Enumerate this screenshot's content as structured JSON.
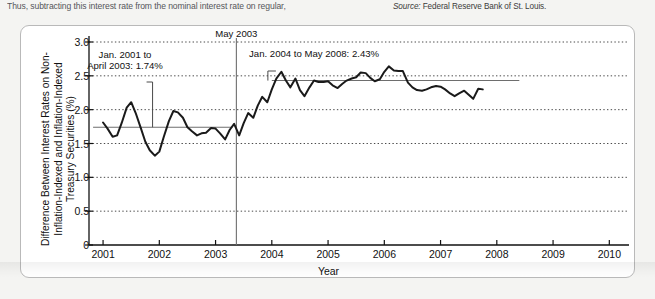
{
  "page": {
    "running_text": "Thus, subtracting this interest rate from the nominal interest rate on regular,",
    "source_prefix": "Source:",
    "source_text": " Federal Reserve Bank of St. Louis."
  },
  "chart_data": {
    "type": "line",
    "title": "",
    "xlabel": "Year",
    "ylabel": "Difference Between Interest Rates on Non-Inflation-Indexed and Inflation-Indexed Treasury Securities (%)",
    "xlim": [
      2000.75,
      2010.35
    ],
    "ylim": [
      0,
      3.0
    ],
    "grid": true,
    "legend": "none",
    "xticks": [
      "2001",
      "2002",
      "2003",
      "2004",
      "2005",
      "2006",
      "2007",
      "2008",
      "2009",
      "2010"
    ],
    "yticks": [
      "0",
      "0.5",
      "1.0",
      "1.5",
      "2.0",
      "2.5",
      "3.0"
    ],
    "annotations": [
      {
        "name": "may-2003-marker",
        "label": "May 2003",
        "x": 2003.37
      },
      {
        "name": "period-1-average",
        "label": "Jan. 2001 to\nApril 2003: 1.74%",
        "value": 1.74,
        "start": 2001.0,
        "end": 2003.3
      },
      {
        "name": "period-2-average",
        "label": "Jan. 2004 to May 2008: 2.43%",
        "value": 2.43,
        "start": 2004.0,
        "end": 2008.4
      }
    ],
    "series": [
      {
        "name": "Difference in interest rates",
        "color": "#1a1a1a",
        "x": [
          2001.0,
          2001.08,
          2001.17,
          2001.25,
          2001.33,
          2001.42,
          2001.5,
          2001.58,
          2001.67,
          2001.75,
          2001.83,
          2001.92,
          2002.0,
          2002.08,
          2002.17,
          2002.25,
          2002.33,
          2002.42,
          2002.5,
          2002.58,
          2002.67,
          2002.75,
          2002.83,
          2002.92,
          2003.0,
          2003.08,
          2003.17,
          2003.25,
          2003.33,
          2003.42,
          2003.5,
          2003.58,
          2003.67,
          2003.75,
          2003.83,
          2003.92,
          2004.0,
          2004.08,
          2004.17,
          2004.25,
          2004.33,
          2004.42,
          2004.5,
          2004.58,
          2004.67,
          2004.75,
          2004.83,
          2004.92,
          2005.0,
          2005.08,
          2005.17,
          2005.25,
          2005.33,
          2005.42,
          2005.5,
          2005.58,
          2005.67,
          2005.75,
          2005.83,
          2005.92,
          2006.0,
          2006.08,
          2006.17,
          2006.25,
          2006.33,
          2006.42,
          2006.5,
          2006.58,
          2006.67,
          2006.75,
          2006.83,
          2006.92,
          2007.0,
          2007.08,
          2007.17,
          2007.25,
          2007.33,
          2007.42,
          2007.5,
          2007.58,
          2007.67,
          2007.75
        ],
        "y": [
          1.81,
          1.72,
          1.6,
          1.62,
          1.8,
          2.03,
          2.11,
          1.95,
          1.73,
          1.53,
          1.4,
          1.32,
          1.38,
          1.6,
          1.83,
          1.98,
          1.96,
          1.88,
          1.74,
          1.68,
          1.62,
          1.65,
          1.66,
          1.73,
          1.72,
          1.65,
          1.56,
          1.7,
          1.79,
          1.62,
          1.8,
          1.95,
          1.88,
          2.06,
          2.19,
          2.11,
          2.3,
          2.46,
          2.56,
          2.43,
          2.33,
          2.46,
          2.29,
          2.2,
          2.33,
          2.43,
          2.41,
          2.41,
          2.42,
          2.36,
          2.32,
          2.38,
          2.43,
          2.46,
          2.48,
          2.55,
          2.54,
          2.47,
          2.42,
          2.45,
          2.56,
          2.64,
          2.58,
          2.57,
          2.57,
          2.4,
          2.33,
          2.29,
          2.28,
          2.3,
          2.33,
          2.35,
          2.34,
          2.3,
          2.24,
          2.2,
          2.24,
          2.28,
          2.22,
          2.16,
          2.31,
          2.3
        ]
      }
    ]
  }
}
